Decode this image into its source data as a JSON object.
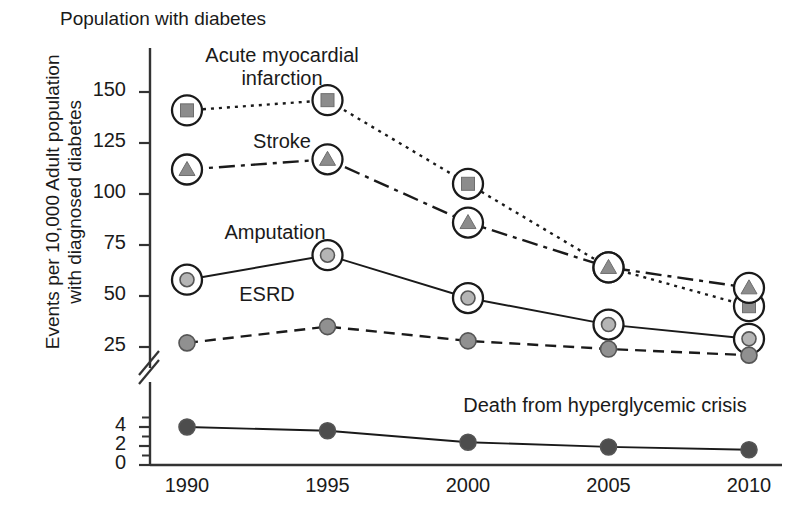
{
  "chart_data": {
    "type": "line",
    "title": "Population with diabetes",
    "xlabel": "",
    "ylabel": "Events per 10,000 Adult population with diagnosed diabetes",
    "ylabel_line1": "Events per 10,000 Adult population",
    "ylabel_line2": "with diagnosed diabetes",
    "categories": [
      1990,
      1995,
      2000,
      2005,
      2010
    ],
    "xtick_labels": [
      "1990",
      "1995",
      "2000",
      "2005",
      "2010"
    ],
    "ytick_labels_upper": [
      "150",
      "125",
      "100",
      "75",
      "50",
      "25"
    ],
    "ytick_values_upper": [
      150,
      125,
      100,
      75,
      50,
      25
    ],
    "ytick_labels_lower": [
      "4",
      "2",
      "0"
    ],
    "ytick_values_lower": [
      4,
      2,
      0
    ],
    "axis_break": true,
    "ylim_upper": [
      25,
      150
    ],
    "ylim_lower": [
      0,
      5
    ],
    "grid": false,
    "legend_position": "inline-annotations",
    "series": [
      {
        "name": "Acute myocardial infarction",
        "label_line1": "Acute myocardial",
        "label_line2": "infarction",
        "marker": "square",
        "marker_fill": "#8c8c8c",
        "halo": true,
        "linestyle": "dotted",
        "scale": "upper",
        "values": [
          141,
          146,
          105,
          64,
          45
        ]
      },
      {
        "name": "Stroke",
        "label_line1": "Stroke",
        "label_line2": "",
        "marker": "triangle",
        "marker_fill": "#8c8c8c",
        "halo": true,
        "linestyle": "dashdot",
        "scale": "upper",
        "values": [
          112,
          117,
          86,
          64,
          54
        ]
      },
      {
        "name": "Amputation",
        "label_line1": "Amputation",
        "label_line2": "",
        "marker": "circle",
        "marker_fill": "#b5b5b5",
        "halo": true,
        "linestyle": "solid",
        "scale": "upper",
        "values": [
          58,
          70,
          49,
          36,
          29
        ]
      },
      {
        "name": "ESRD",
        "label_line1": "ESRD",
        "label_line2": "",
        "marker": "circle",
        "marker_fill": "#909090",
        "halo": false,
        "linestyle": "dashed",
        "scale": "upper",
        "values": [
          27,
          35,
          28,
          24,
          21
        ]
      },
      {
        "name": "Death from hyperglycemic crisis",
        "label_line1": "Death from hyperglycemic crisis",
        "label_line2": "",
        "marker": "circle",
        "marker_fill": "#4d4d4d",
        "halo": false,
        "linestyle": "solid",
        "scale": "lower",
        "values": [
          4.0,
          3.6,
          2.4,
          1.9,
          1.6
        ]
      }
    ],
    "colors": {
      "axis": "#333333",
      "line": "#1a1a1a",
      "text": "#1a1a1a",
      "background": "#ffffff"
    }
  }
}
